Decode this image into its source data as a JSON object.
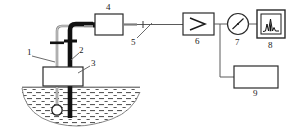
{
  "diagram": {
    "background_color": "#ffffff",
    "line_color": "#3a3a3a",
    "dark_tube_color": "#111111",
    "light_tube_color": "#8a8a8a",
    "hatch_color": "#555555",
    "components": [
      {
        "id": "1",
        "label": "1",
        "name": "thin-probe-tube",
        "shape": "vertical-thin-tube"
      },
      {
        "id": "2",
        "label": "2",
        "name": "thick-probe-tube",
        "shape": "vertical-thick-tube"
      },
      {
        "id": "3",
        "label": "3",
        "name": "collar-block",
        "shape": "rectangle"
      },
      {
        "id": "4",
        "label": "4",
        "name": "sampling-box",
        "shape": "rectangle"
      },
      {
        "id": "5",
        "label": "5",
        "name": "line-connector",
        "shape": "tick-on-line"
      },
      {
        "id": "6",
        "label": "6",
        "name": "amplifier",
        "shape": "rectangle-with-triangle"
      },
      {
        "id": "7",
        "label": "7",
        "name": "gauge-meter",
        "shape": "circle-with-needle"
      },
      {
        "id": "8",
        "label": "8",
        "name": "recorder-display",
        "shape": "double-rectangle-with-peaks"
      },
      {
        "id": "9",
        "label": "9",
        "name": "control-unit",
        "shape": "rectangle"
      }
    ],
    "medium": {
      "name": "hatched-bath",
      "shape": "basin"
    },
    "probe_tip": {
      "name": "bulb-sensor",
      "shape": "circle"
    }
  }
}
